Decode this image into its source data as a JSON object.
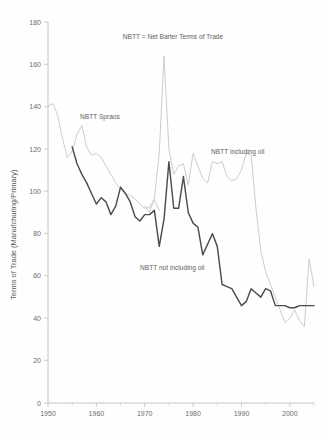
{
  "chart_data": {
    "type": "line",
    "title": "NBTT = Net Barter Terms of Trade",
    "xlabel": "",
    "ylabel": "Terms of Trade (Manufchuring/Primary)",
    "xlim": [
      1950,
      2005
    ],
    "ylim": [
      0,
      180
    ],
    "xticks": [
      1950,
      1960,
      1970,
      1980,
      1990,
      2000
    ],
    "yticks": [
      0,
      20,
      40,
      60,
      80,
      100,
      120,
      140,
      160,
      180
    ],
    "grid": false,
    "legend": "annotations-inline",
    "annotations": [
      {
        "text": "NBTT = Net Barter Terms of Trade",
        "x": 1973,
        "y": 172
      },
      {
        "text": "NBTT Spraos",
        "x": 1960.5,
        "y": 132
      },
      {
        "text": "NBTT including oil",
        "x": 1992.5,
        "y": 118
      },
      {
        "text": "NBTT not including oil",
        "x": 1982,
        "y": 62
      }
    ],
    "series": [
      {
        "name": "NBTT Spraos",
        "color": "#c9c9c9",
        "x": [
          1950,
          1951,
          1952,
          1953,
          1954,
          1955,
          1956,
          1957,
          1958,
          1959,
          1960,
          1961,
          1962,
          1963,
          1964,
          1965,
          1966,
          1967,
          1968,
          1969,
          1970,
          1971,
          1972,
          1973
        ],
        "values": [
          140,
          141.5,
          136,
          125,
          116,
          119,
          127,
          131,
          121,
          117,
          118,
          116,
          112,
          108,
          104,
          101,
          99,
          98,
          96.5,
          94,
          92,
          92.5,
          96,
          91
        ]
      },
      {
        "name": "NBTT including oil",
        "color": "#c9c9c9",
        "x": [
          1970,
          1971,
          1972,
          1973,
          1974,
          1975,
          1976,
          1977,
          1978,
          1979,
          1980,
          1981,
          1982,
          1983,
          1984,
          1985,
          1986,
          1987,
          1988,
          1989,
          1990,
          1991,
          1992,
          1993,
          1994,
          1995,
          1996,
          1997,
          1998,
          1999,
          2000,
          2001,
          2002,
          2003,
          2004,
          2005
        ],
        "values": [
          93,
          90,
          97,
          118,
          164,
          120,
          108,
          112,
          113,
          103,
          118,
          112,
          106,
          104,
          114,
          113,
          114,
          107,
          105,
          106,
          110,
          118,
          117,
          92,
          72,
          62,
          56,
          50,
          44,
          38,
          40,
          44,
          39,
          36,
          68,
          55
        ]
      },
      {
        "name": "NBTT not including oil",
        "color": "#4d4d4d",
        "x": [
          1955,
          1956,
          1957,
          1958,
          1959,
          1960,
          1961,
          1962,
          1963,
          1964,
          1965,
          1966,
          1967,
          1968,
          1969,
          1970,
          1971,
          1972,
          1973,
          1974,
          1975,
          1976,
          1977,
          1978,
          1979,
          1980,
          1981,
          1982,
          1983,
          1984,
          1985,
          1986,
          1987,
          1988,
          1989,
          1990,
          1991,
          1992,
          1993,
          1994,
          1995,
          1996,
          1997,
          1998,
          1999,
          2000,
          2001,
          2002,
          2003,
          2004,
          2005
        ],
        "values": [
          121,
          113,
          108,
          104,
          99,
          94,
          97,
          95,
          89,
          93,
          102,
          99,
          95,
          88,
          86,
          89,
          89,
          91,
          74,
          87,
          114,
          92,
          92,
          107,
          90,
          85,
          83,
          70,
          75,
          80,
          74,
          56,
          55,
          54,
          50,
          46,
          48,
          54,
          52,
          50,
          54,
          53,
          46,
          46,
          46,
          45,
          45,
          46,
          46,
          46,
          46
        ]
      }
    ]
  }
}
